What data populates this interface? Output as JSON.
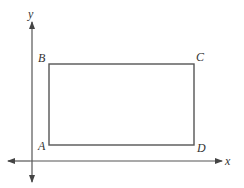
{
  "diagram": {
    "axes": {
      "x_label": "x",
      "y_label": "y"
    },
    "rectangle": {
      "vertices": [
        {
          "name": "A",
          "position": "bottom-left"
        },
        {
          "name": "B",
          "position": "top-left"
        },
        {
          "name": "C",
          "position": "top-right"
        },
        {
          "name": "D",
          "position": "bottom-right"
        }
      ]
    },
    "colors": {
      "line": "#555555",
      "text": "#333333",
      "background": "#ffffff"
    }
  }
}
